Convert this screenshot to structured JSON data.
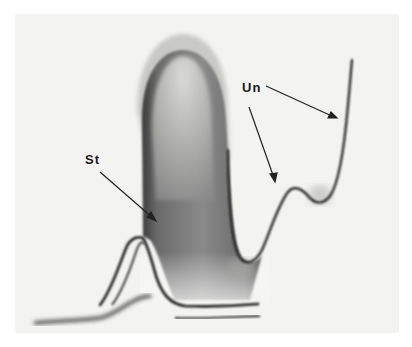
{
  "figure": {
    "type": "photograph",
    "labels": [
      {
        "id": "st",
        "text": "St"
      },
      {
        "id": "un",
        "text": "Un"
      }
    ],
    "colors": {
      "background": "#ffffff",
      "photo_background": "#f3f3f2",
      "stained_region": "#6e6e6e",
      "curve_line": "#1a1a1a"
    }
  }
}
